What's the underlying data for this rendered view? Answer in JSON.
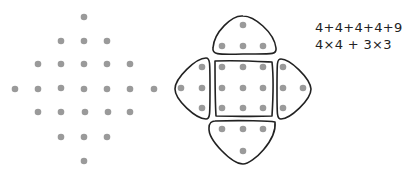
{
  "diagram": {
    "left_figure": {
      "description": "diamond dot pattern, 25 dots",
      "rows": [
        1,
        3,
        5,
        7,
        5,
        3,
        1
      ],
      "dot_color": "#9a9a9a"
    },
    "right_figure": {
      "description": "same pattern partitioned: 3x3 square plus four triangles of 4 dots",
      "groups": [
        "top-triangle",
        "left-triangle",
        "center-square",
        "right-triangle",
        "bottom-triangle"
      ],
      "outline_color": "#222222"
    },
    "equations": {
      "line1": "4+4+4+4+9",
      "line2": "4×4 + 3×3"
    }
  }
}
